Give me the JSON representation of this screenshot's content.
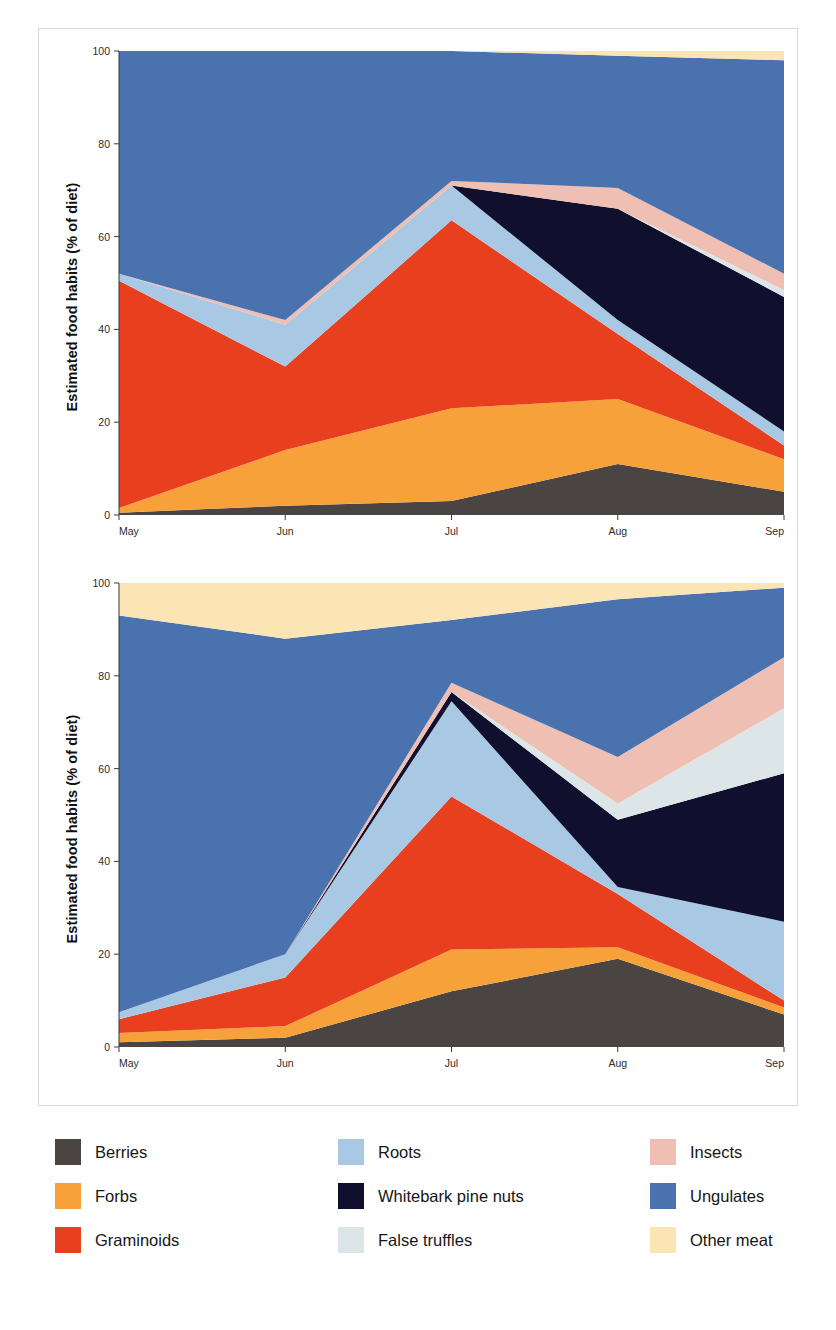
{
  "figure": {
    "ylabel": "Estimated food habits (% of diet)",
    "panels": [
      {
        "id": "male",
        "title": "Male grizzly bears"
      },
      {
        "id": "female",
        "title": "Female grizzly bears"
      }
    ]
  },
  "legend": {
    "columns": [
      [
        {
          "label": "Berries",
          "color": "#4a4543"
        },
        {
          "label": "Forbs",
          "color": "#f7a13a"
        },
        {
          "label": "Graminoids",
          "color": "#e8401f"
        }
      ],
      [
        {
          "label": "Roots",
          "color": "#a9c8e4"
        },
        {
          "label": "Whitebark pine nuts",
          "color": "#100f2e"
        },
        {
          "label": "False truffles",
          "color": "#dce6e8"
        }
      ],
      [
        {
          "label": "Insects",
          "color": "#eebfb2"
        },
        {
          "label": "Ungulates",
          "color": "#4a72ae"
        },
        {
          "label": "Other meat",
          "color": "#fbe5b4"
        }
      ]
    ]
  },
  "chart_data": [
    {
      "type": "area",
      "title": "Male grizzly bears",
      "xlabel": "",
      "ylabel": "Estimated food habits (% of diet)",
      "categories": [
        "May",
        "Jun",
        "Jul",
        "Aug",
        "Sep"
      ],
      "xticks": [
        "May",
        "Jun",
        "Jul",
        "Aug",
        "Sep"
      ],
      "yticks": [
        0,
        20,
        40,
        60,
        80,
        100
      ],
      "ylim": [
        0,
        100
      ],
      "stacked": true,
      "grid": false,
      "legend_position": "below-figure",
      "series": [
        {
          "name": "Berries",
          "color": "#4a4543",
          "values": [
            0.5,
            2.0,
            3.0,
            11.0,
            5.0
          ]
        },
        {
          "name": "Forbs",
          "color": "#f7a13a",
          "values": [
            1.0,
            12.0,
            20.0,
            14.0,
            7.0
          ]
        },
        {
          "name": "Graminoids",
          "color": "#e8401f",
          "values": [
            49.0,
            18.0,
            40.5,
            14.0,
            3.0
          ]
        },
        {
          "name": "Roots",
          "color": "#a9c8e4",
          "values": [
            1.5,
            9.0,
            7.5,
            3.0,
            3.0
          ]
        },
        {
          "name": "Whitebark pine nuts",
          "color": "#100f2e",
          "values": [
            0.0,
            0.0,
            0.0,
            24.0,
            29.0
          ]
        },
        {
          "name": "False truffles",
          "color": "#dce6e8",
          "values": [
            0.0,
            0.0,
            0.0,
            0.0,
            1.5
          ]
        },
        {
          "name": "Insects",
          "color": "#eebfb2",
          "values": [
            0.0,
            1.0,
            1.0,
            4.5,
            3.5
          ]
        },
        {
          "name": "Ungulates",
          "color": "#4a72ae",
          "values": [
            48.0,
            58.0,
            28.0,
            28.5,
            46.0
          ]
        },
        {
          "name": "Other meat",
          "color": "#fbe5b4",
          "values": [
            0.0,
            0.0,
            0.0,
            1.0,
            2.0
          ]
        }
      ]
    },
    {
      "type": "area",
      "title": "Female grizzly bears",
      "xlabel": "",
      "ylabel": "Estimated food habits (% of diet)",
      "categories": [
        "May",
        "Jun",
        "Jul",
        "Aug",
        "Sep"
      ],
      "xticks": [
        "May",
        "Jun",
        "Jul",
        "Aug",
        "Sep"
      ],
      "yticks": [
        0,
        20,
        40,
        60,
        80,
        100
      ],
      "ylim": [
        0,
        100
      ],
      "stacked": true,
      "grid": false,
      "legend_position": "below-figure",
      "series": [
        {
          "name": "Berries",
          "color": "#4a4543",
          "values": [
            1.0,
            2.0,
            12.0,
            19.0,
            7.0
          ]
        },
        {
          "name": "Forbs",
          "color": "#f7a13a",
          "values": [
            2.0,
            2.5,
            9.0,
            2.5,
            1.5
          ]
        },
        {
          "name": "Graminoids",
          "color": "#e8401f",
          "values": [
            3.0,
            10.5,
            33.0,
            11.5,
            1.5
          ]
        },
        {
          "name": "Roots",
          "color": "#a9c8e4",
          "values": [
            1.5,
            5.0,
            20.5,
            1.5,
            17.0
          ]
        },
        {
          "name": "Whitebark pine nuts",
          "color": "#100f2e",
          "values": [
            0.0,
            0.0,
            2.0,
            14.5,
            32.0
          ]
        },
        {
          "name": "False truffles",
          "color": "#dce6e8",
          "values": [
            0.0,
            0.0,
            0.0,
            3.5,
            14.0
          ]
        },
        {
          "name": "Insects",
          "color": "#eebfb2",
          "values": [
            0.0,
            0.0,
            2.0,
            10.0,
            11.0
          ]
        },
        {
          "name": "Ungulates",
          "color": "#4a72ae",
          "values": [
            85.5,
            68.0,
            13.5,
            34.0,
            15.0
          ]
        },
        {
          "name": "Other meat",
          "color": "#fbe5b4",
          "values": [
            7.0,
            12.0,
            8.0,
            3.5,
            1.0
          ]
        }
      ]
    }
  ]
}
